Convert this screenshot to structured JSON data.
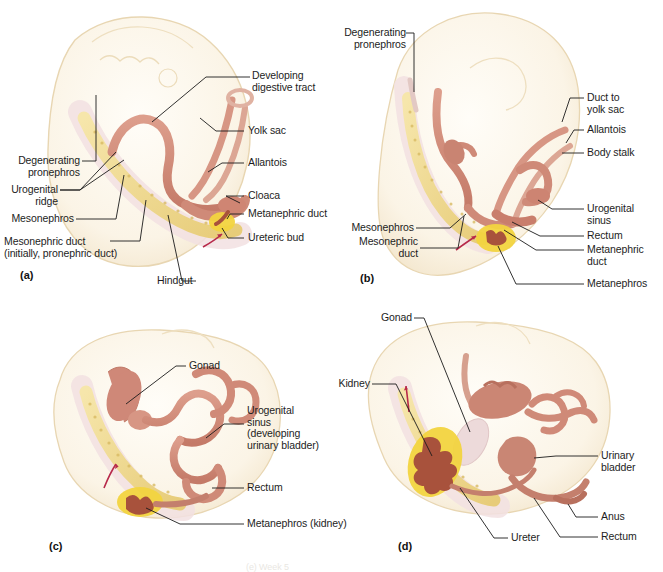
{
  "figure": {
    "bottom_caption_partial": "(e) Week 5",
    "colors": {
      "body_fill": "#faf2e2",
      "body_edge": "#e6d3ad",
      "duct": "#d08a78",
      "duct_dark": "#b5604c",
      "mesonephros": "#f0d98a",
      "mesonephros_edge": "#dcc06a",
      "metanephros": "#f2d43f",
      "kidney_calyx": "#a8523c",
      "gonad": "#ecd6d6",
      "arrow_red": "#b7294a",
      "leader_line": "#1b1b1b",
      "text": "#1d1d1d"
    }
  },
  "panels": [
    {
      "id": "a",
      "marker": "(a)",
      "labels": [
        {
          "name": "developing-digestive-tract",
          "text": "Developing\ndigestive tract"
        },
        {
          "name": "yolk-sac",
          "text": "Yolk sac"
        },
        {
          "name": "allantois",
          "text": "Allantois"
        },
        {
          "name": "cloaca",
          "text": "Cloaca"
        },
        {
          "name": "metanephric-duct",
          "text": "Metanephric duct"
        },
        {
          "name": "ureteric-bud",
          "text": "Ureteric bud"
        },
        {
          "name": "degenerating-pronephros",
          "text": "Degenerating\npronephros"
        },
        {
          "name": "urogenital-ridge",
          "text": "Urogenital\nridge"
        },
        {
          "name": "mesonephros",
          "text": "Mesonephros"
        },
        {
          "name": "mesonephric-duct",
          "text": "Mesonephric duct\n(initially, pronephric duct)"
        },
        {
          "name": "hindgut",
          "text": "Hindgut"
        }
      ]
    },
    {
      "id": "b",
      "marker": "(b)",
      "labels": [
        {
          "name": "degenerating-pronephros",
          "text": "Degenerating\npronephros"
        },
        {
          "name": "duct-to-yolk-sac",
          "text": "Duct to\nyolk sac"
        },
        {
          "name": "allantois",
          "text": "Allantois"
        },
        {
          "name": "body-stalk",
          "text": "Body stalk"
        },
        {
          "name": "urogenital-sinus",
          "text": "Urogenital\nsinus"
        },
        {
          "name": "rectum",
          "text": "Rectum"
        },
        {
          "name": "metanephric-duct",
          "text": "Metanephric\nduct"
        },
        {
          "name": "mesonephros",
          "text": "Mesonephros"
        },
        {
          "name": "mesonephric-duct",
          "text": "Mesonephric\nduct"
        },
        {
          "name": "metanephros",
          "text": "Metanephros"
        }
      ]
    },
    {
      "id": "c",
      "marker": "(c)",
      "labels": [
        {
          "name": "gonad",
          "text": "Gonad"
        },
        {
          "name": "urogenital-sinus",
          "text": "Urogenital\nsinus\n(developing\nurinary bladder)"
        },
        {
          "name": "rectum",
          "text": "Rectum"
        },
        {
          "name": "metanephros-kidney",
          "text": "Metanephros (kidney)"
        }
      ]
    },
    {
      "id": "d",
      "marker": "(d)",
      "labels": [
        {
          "name": "gonad",
          "text": "Gonad"
        },
        {
          "name": "kidney",
          "text": "Kidney"
        },
        {
          "name": "urinary-bladder",
          "text": "Urinary\nbladder"
        },
        {
          "name": "anus",
          "text": "Anus"
        },
        {
          "name": "rectum",
          "text": "Rectum"
        },
        {
          "name": "ureter",
          "text": "Ureter"
        }
      ]
    }
  ]
}
